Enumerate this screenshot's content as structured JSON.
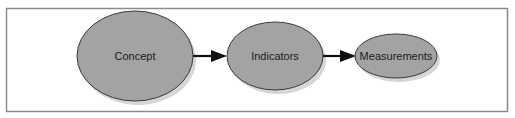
{
  "diagram": {
    "type": "flow",
    "nodes": [
      {
        "id": "concept",
        "label": "Concept",
        "cx": 135,
        "cy": 56,
        "rx": 58,
        "ry": 45
      },
      {
        "id": "indicators",
        "label": "Indicators",
        "cx": 275,
        "cy": 56,
        "rx": 48,
        "ry": 34
      },
      {
        "id": "measurements",
        "label": "Measurements",
        "cx": 396,
        "cy": 56,
        "rx": 41,
        "ry": 22
      }
    ],
    "edges": [
      {
        "from": "concept",
        "to": "indicators"
      },
      {
        "from": "indicators",
        "to": "measurements"
      }
    ],
    "colors": {
      "node_fill": "#a3a3a3",
      "node_stroke": "#3a3a3a",
      "shadow": "#d4d4d4",
      "arrow": "#111111",
      "frame": "#8a8a8a"
    }
  }
}
